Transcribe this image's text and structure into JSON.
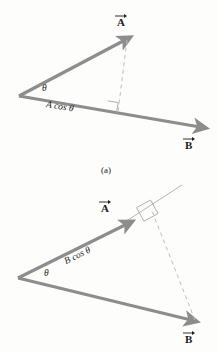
{
  "figure": {
    "title": "",
    "background_color": "#fdfdfc",
    "vector_color": "#8d8d8d",
    "thin_line_color": "#b9b9b9",
    "text_color": "#1b1b1b",
    "panels": [
      {
        "id": "a",
        "caption": "(a)",
        "description": "Projection of vector A onto vector B",
        "labels": {
          "vector_a": "A",
          "vector_b": "B",
          "angle": "θ",
          "projection": "A cos θ"
        },
        "geometry": {
          "origin": [
            19,
            96
          ],
          "a_tip": [
            128,
            38
          ],
          "b_tip": [
            205,
            130
          ],
          "foot": [
            117,
            112
          ]
        }
      },
      {
        "id": "b",
        "caption": "(b)",
        "description": "Projection of vector B onto vector A",
        "labels": {
          "vector_a": "A",
          "vector_b": "B",
          "angle": "θ",
          "projection": "B cos θ"
        },
        "geometry": {
          "origin": [
            18,
            278
          ],
          "a_tip": [
            130,
            222
          ],
          "b_tip": [
            196,
            322
          ],
          "foot": [
            156,
            202
          ],
          "extension_tip": [
            182,
            185
          ]
        }
      }
    ]
  }
}
